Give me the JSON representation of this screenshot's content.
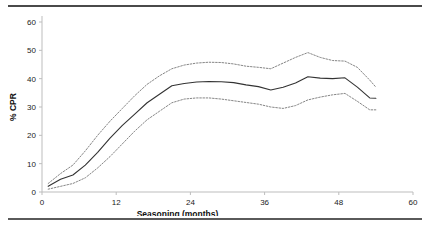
{
  "figure": {
    "clipped_caption_sliver": "",
    "rules": {
      "color": "#4a4a4a"
    }
  },
  "chart_data": {
    "type": "line",
    "title": "",
    "xlabel": "Seasoning (months)",
    "ylabel": "% CPR",
    "xlim": [
      0,
      60
    ],
    "ylim": [
      0,
      60
    ],
    "xticks": [
      0,
      12,
      24,
      36,
      48,
      60
    ],
    "xticklabels": [
      "0",
      "12",
      "24",
      "36",
      "48",
      "60"
    ],
    "yticks": [
      0,
      10,
      20,
      30,
      40,
      50,
      60
    ],
    "yticklabels": [
      "0",
      "10",
      "20",
      "30",
      "40",
      "50",
      "60"
    ],
    "grid": false,
    "legend": null,
    "x": [
      1,
      3,
      5,
      7,
      9,
      11,
      13,
      15,
      17,
      19,
      21,
      23,
      25,
      27,
      29,
      31,
      33,
      35,
      37,
      39,
      41,
      43,
      45,
      47,
      49,
      51,
      53,
      54
    ],
    "series": [
      {
        "name": "mean",
        "style": "solid",
        "color": "#333333",
        "values": [
          2.0,
          4.5,
          6.0,
          9.5,
          14.0,
          19.0,
          23.5,
          27.5,
          31.5,
          34.5,
          37.5,
          38.3,
          38.8,
          39.0,
          38.9,
          38.6,
          37.8,
          37.2,
          36.0,
          37.0,
          38.5,
          40.7,
          40.2,
          40.0,
          40.3,
          37.0,
          33.2,
          33.1
        ]
      },
      {
        "name": "upper-confidence-band",
        "style": "dotted",
        "color": "#777777",
        "values": [
          3.0,
          6.5,
          9.5,
          14.5,
          20.0,
          25.0,
          29.5,
          34.0,
          38.0,
          41.0,
          43.5,
          44.8,
          45.5,
          45.8,
          45.7,
          45.2,
          44.4,
          44.0,
          43.5,
          45.5,
          47.5,
          49.2,
          47.5,
          46.4,
          46.2,
          44.0,
          39.5,
          37.0
        ]
      },
      {
        "name": "lower-confidence-band",
        "style": "dotted",
        "color": "#777777",
        "values": [
          1.0,
          2.0,
          3.0,
          5.0,
          8.5,
          12.5,
          17.0,
          21.5,
          25.5,
          28.5,
          31.5,
          32.8,
          33.2,
          33.2,
          32.8,
          32.2,
          31.6,
          31.0,
          30.0,
          29.5,
          30.5,
          32.5,
          33.5,
          34.3,
          34.8,
          32.0,
          29.0,
          29.0
        ]
      }
    ]
  }
}
